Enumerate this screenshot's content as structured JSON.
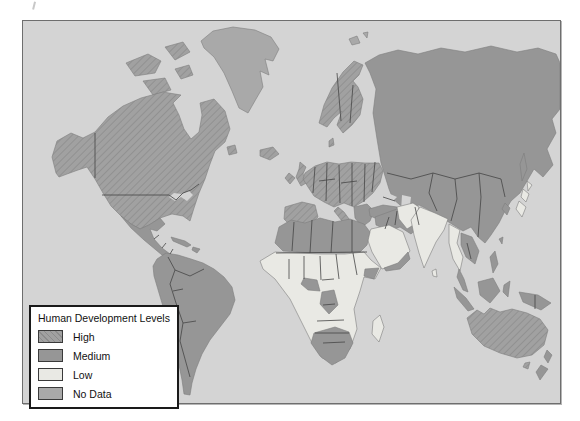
{
  "map": {
    "ocean_color": "#d4d4d4",
    "frame_color": "#6e6e6e",
    "coast_color": "#7e7e7e",
    "border_line_color": "#454545"
  },
  "levels": {
    "high": {
      "label": "High",
      "color": "#a1a1a1",
      "hatch": "#8c8c8c"
    },
    "medium": {
      "label": "Medium",
      "color": "#969696"
    },
    "low": {
      "label": "Low",
      "color": "#e9e9e4"
    },
    "nodata": {
      "label": "No Data",
      "color": "#a9a9a9"
    }
  },
  "legend": {
    "title": "Human Development Levels",
    "items": [
      {
        "label": "High",
        "level": "high"
      },
      {
        "label": "Medium",
        "level": "medium"
      },
      {
        "label": "Low",
        "level": "low"
      },
      {
        "label": "No Data",
        "level": "nodata"
      }
    ]
  },
  "regions": {
    "greenland": "nodata",
    "svalbard": "nodata",
    "arctic-islands": "high",
    "north-america": "high",
    "newfoundland": "high",
    "mexico-central-america": "medium",
    "cuba": "medium",
    "hispaniola": "medium",
    "south-america": "medium",
    "iceland": "high",
    "uk": "high",
    "ireland": "high",
    "scandinavia": "high",
    "denmark": "high",
    "europe": "high",
    "iberia": "high",
    "italy": "high",
    "sicily": "high",
    "southeast-europe": "medium",
    "russia-asia": "medium",
    "sakhalin": "medium",
    "turkey": "medium",
    "middle-east": "medium",
    "arabia": "low",
    "yemen-oman": "medium",
    "north-africa": "medium",
    "sub-saharan-africa": "low",
    "gulf-guinea": "medium",
    "central-africa": "medium",
    "horn-somalia": "medium",
    "southern-africa": "medium",
    "madagascar": "low",
    "pakistan-afghanistan": "low",
    "india": "low",
    "sri-lanka": "low",
    "myanmar-thailand": "low",
    "indochina": "medium",
    "malay-peninsula": "medium",
    "sumatra": "medium",
    "java": "medium",
    "borneo": "medium",
    "sulawesi": "medium",
    "new-guinea": "medium",
    "philippines": "medium",
    "taiwan": "medium",
    "korea": "medium",
    "japan": "low",
    "australia": "high",
    "tasmania": "high",
    "new-zealand": "medium"
  }
}
